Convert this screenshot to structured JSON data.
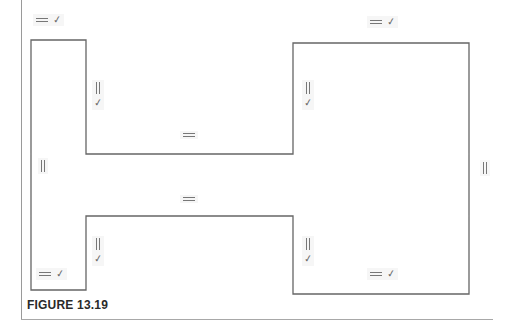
{
  "figure": {
    "caption": "FIGURE 13.19",
    "line_color": "#666666",
    "symbol_color": "#777777"
  },
  "profile": {
    "points": [
      [
        31,
        40
      ],
      [
        86,
        40
      ],
      [
        86,
        154
      ],
      [
        293,
        154
      ],
      [
        293,
        43
      ],
      [
        469,
        43
      ],
      [
        469,
        294
      ],
      [
        293,
        294
      ],
      [
        293,
        216
      ],
      [
        86,
        216
      ],
      [
        86,
        290
      ],
      [
        31,
        290
      ]
    ]
  },
  "symbols": [
    {
      "id": "top-left-edge",
      "type": "horizontal+tangent",
      "glyphs": [
        "horizontal",
        "check"
      ],
      "x": 33,
      "y": 14
    },
    {
      "id": "left-rect-right-upper",
      "type": "vertical+tangent",
      "glyphs": [
        "vertical",
        "check"
      ],
      "x": 92,
      "y": 80
    },
    {
      "id": "neck-top",
      "type": "horizontal",
      "glyphs": [
        "horizontal"
      ],
      "x": 180,
      "y": 131
    },
    {
      "id": "left-outer-edge",
      "type": "vertical",
      "glyphs": [
        "vertical"
      ],
      "x": 38,
      "y": 158
    },
    {
      "id": "neck-bottom",
      "type": "horizontal",
      "glyphs": [
        "horizontal"
      ],
      "x": 180,
      "y": 195
    },
    {
      "id": "left-rect-right-lower",
      "type": "vertical+tangent",
      "glyphs": [
        "vertical",
        "check"
      ],
      "x": 92,
      "y": 236
    },
    {
      "id": "bottom-left-edge",
      "type": "horizontal+tangent",
      "glyphs": [
        "horizontal",
        "check"
      ],
      "x": 36,
      "y": 268
    },
    {
      "id": "top-right-edge",
      "type": "horizontal+tangent",
      "glyphs": [
        "horizontal",
        "check"
      ],
      "x": 367,
      "y": 16
    },
    {
      "id": "right-rect-left-upper",
      "type": "vertical+tangent",
      "glyphs": [
        "vertical",
        "check"
      ],
      "x": 302,
      "y": 80
    },
    {
      "id": "right-outer-edge",
      "type": "vertical",
      "glyphs": [
        "vertical"
      ],
      "x": 480,
      "y": 160
    },
    {
      "id": "right-rect-left-lower",
      "type": "vertical+tangent",
      "glyphs": [
        "vertical",
        "check"
      ],
      "x": 302,
      "y": 236
    },
    {
      "id": "bottom-right-edge",
      "type": "horizontal+tangent",
      "glyphs": [
        "horizontal",
        "check"
      ],
      "x": 367,
      "y": 268
    }
  ],
  "glyph_text": {
    "check": "✓"
  }
}
